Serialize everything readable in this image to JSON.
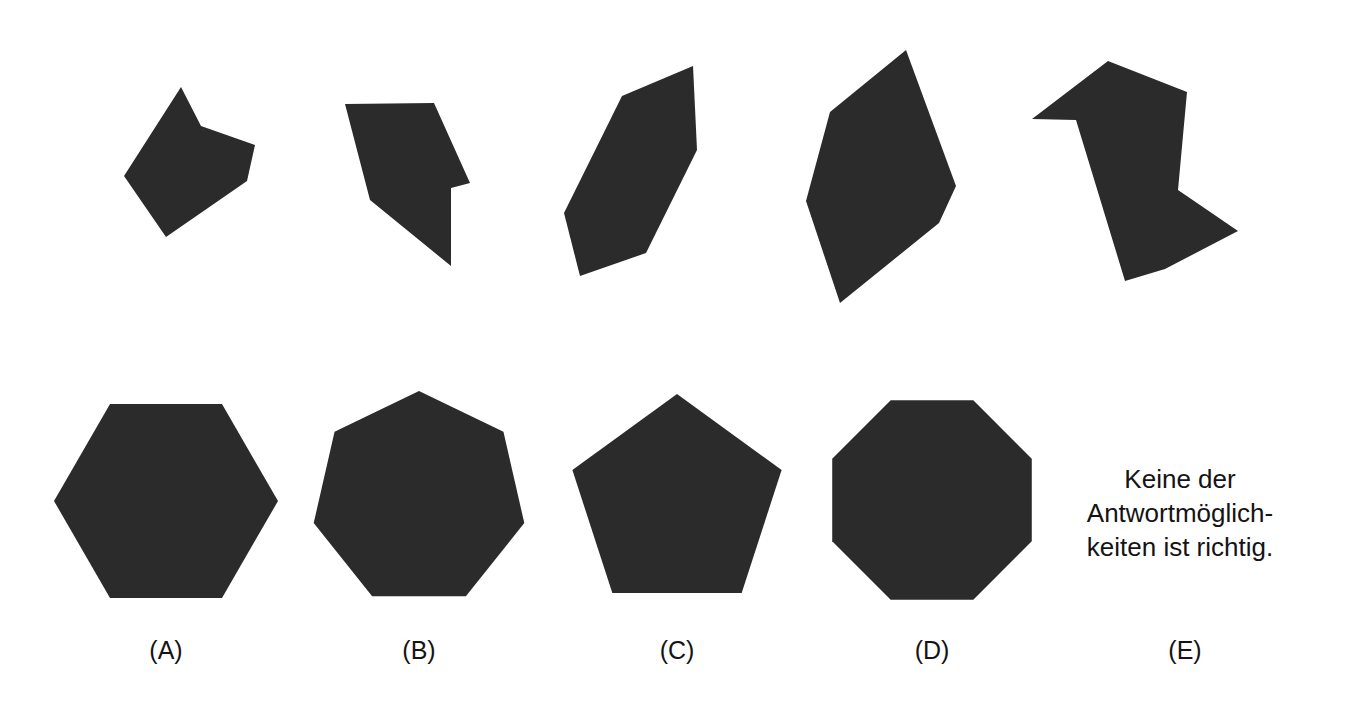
{
  "page": {
    "width": 1361,
    "height": 713,
    "background_color": "#ffffff",
    "shape_fill_color": "#2b2b2b",
    "text_color": "#141414",
    "kind": "visual-puzzle-sheet"
  },
  "puzzle": {
    "top_row_description": "five irregular dark polygon pieces",
    "bottom_row_description": "four regular dark polygons plus a text answer option"
  },
  "pieces": [
    {
      "id": "piece-1",
      "name": "irregular-piece-1",
      "sides": 6,
      "points": "181,87 201,126 255,145 247,181 166,237 124,176"
    },
    {
      "id": "piece-2",
      "name": "irregular-piece-2",
      "sides": 6,
      "points": "345,104 434,103 470,183 451,188 451,266 370,200"
    },
    {
      "id": "piece-3",
      "name": "irregular-piece-3",
      "sides": 6,
      "points": "693,66 622,96 564,213 580,276 646,253 697,150"
    },
    {
      "id": "piece-4",
      "name": "irregular-piece-4",
      "sides": 6,
      "points": "906,50 830,112 806,201 840,303 939,223 956,186"
    },
    {
      "id": "piece-5",
      "name": "irregular-piece-5",
      "sides": 7,
      "points": "1108,61 1032,119 1076,120 1125,281 1165,269 1238,231 1178,190 1187,92"
    }
  ],
  "options": [
    {
      "key": "A",
      "label": "(A)",
      "shape": "hexagon",
      "sides": 6,
      "center_x": 166,
      "center_y": 501,
      "radius": 112,
      "rotation_deg": 30
    },
    {
      "key": "B",
      "label": "(B)",
      "shape": "heptagon",
      "sides": 7,
      "center_x": 419,
      "center_y": 499,
      "radius": 108,
      "rotation_deg": 0
    },
    {
      "key": "C",
      "label": "(C)",
      "shape": "pentagon",
      "sides": 5,
      "center_x": 677,
      "center_y": 504,
      "radius": 110,
      "rotation_deg": 0
    },
    {
      "key": "D",
      "label": "(D)",
      "shape": "octagon",
      "sides": 8,
      "center_x": 932,
      "center_y": 500,
      "radius": 108,
      "rotation_deg": 22.5
    },
    {
      "key": "E",
      "label": "(E)",
      "shape": "text",
      "sides": 0,
      "center_x": 1185,
      "center_y": 504,
      "radius": 0,
      "rotation_deg": 0
    }
  ],
  "answer_text": {
    "line1": "Keine der",
    "line2": "Antwortmöglich-",
    "line3": "keiten ist richtig."
  },
  "labels": {
    "a": "(A)",
    "b": "(B)",
    "c": "(C)",
    "d": "(D)",
    "e": "(E)"
  }
}
